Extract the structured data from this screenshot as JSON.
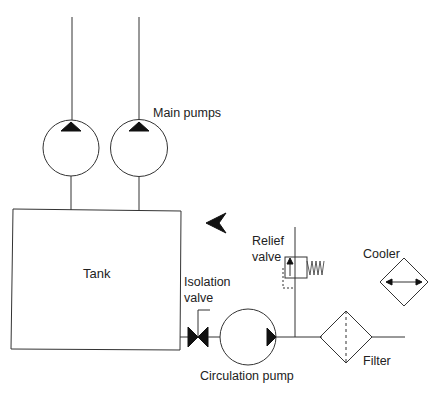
{
  "diagram": {
    "type": "hydraulic schematic",
    "labels": {
      "main_pumps": "Main pumps",
      "tank": "Tank",
      "isolation_line1": "Isolation",
      "isolation_line2": "valve",
      "relief_line1": "Relief",
      "relief_line2": "valve",
      "cooler": "Cooler",
      "circulation_pump": "Circulation pump",
      "filter": "Filter"
    },
    "components": [
      {
        "id": "main-pump-1",
        "kind": "pump"
      },
      {
        "id": "main-pump-2",
        "kind": "pump"
      },
      {
        "id": "tank",
        "kind": "reservoir"
      },
      {
        "id": "isolation-valve",
        "kind": "valve"
      },
      {
        "id": "circulation-pump",
        "kind": "pump"
      },
      {
        "id": "relief-valve",
        "kind": "valve"
      },
      {
        "id": "filter",
        "kind": "filter"
      },
      {
        "id": "cooler",
        "kind": "heat-exchanger"
      }
    ],
    "colors": {
      "line": "#333333",
      "fill": "#111111",
      "background": "#ffffff"
    }
  }
}
